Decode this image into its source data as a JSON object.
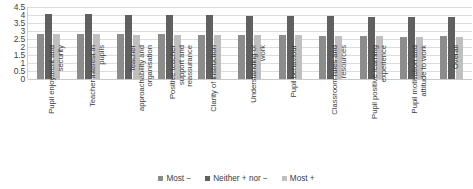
{
  "chart_data": {
    "type": "bar",
    "title": "",
    "xlabel": "",
    "ylabel": "",
    "ylim": [
      0,
      4.5
    ],
    "grid": true,
    "legend_position": "bottom",
    "yticks": [
      "0",
      "0.5",
      "1",
      "1.5",
      "2",
      "2.5",
      "3",
      "3.5",
      "4",
      "4.5"
    ],
    "ytick_values": [
      0,
      0.5,
      1,
      1.5,
      2,
      2.5,
      3,
      3.5,
      4,
      4.5
    ],
    "categories": [
      "Pupil enjoyment and security",
      "Teacher interest in pupils",
      "Teacher approachability and organisation",
      "Positive teacher support and reassurance",
      "Clarity of instruction",
      "Understanding of work",
      "Pupil behaviour",
      "Classroom rules and resources",
      "Pupil positive learning experience",
      "Pupil motivation and attitude to work",
      "Overall"
    ],
    "series": [
      {
        "name": "Most −",
        "color": "#8c8c8c",
        "values": [
          2.82,
          2.8,
          2.8,
          2.79,
          2.76,
          2.75,
          2.73,
          2.7,
          2.68,
          2.65,
          2.66
        ]
      },
      {
        "name": "Neither + nor −",
        "color": "#606060",
        "values": [
          4.05,
          4.05,
          4.03,
          4.02,
          3.98,
          3.96,
          3.94,
          3.92,
          3.9,
          3.88,
          3.87
        ]
      },
      {
        "name": "Most +",
        "color": "#bfbfbf",
        "values": [
          2.8,
          2.79,
          2.78,
          2.77,
          2.76,
          2.75,
          2.72,
          2.7,
          2.66,
          2.64,
          2.63
        ]
      }
    ]
  },
  "legend": {
    "items": [
      {
        "label": "Most −",
        "color": "#8c8c8c"
      },
      {
        "label": "Neither + nor −",
        "color": "#606060"
      },
      {
        "label": "Most +",
        "color": "#bfbfbf"
      }
    ]
  }
}
